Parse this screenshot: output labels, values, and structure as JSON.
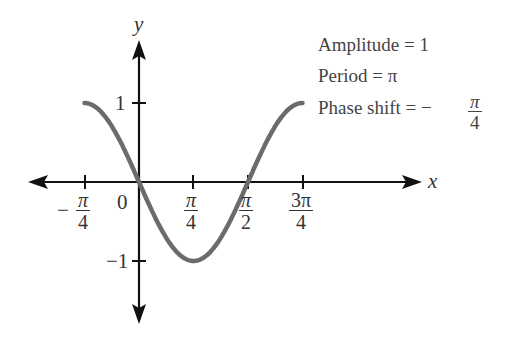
{
  "chart_data": {
    "type": "line",
    "title": "",
    "function": "y = cos(2(x + π/4)) = -sin(2x)",
    "xlabel": "x",
    "ylabel": "y",
    "x_ticks": [
      "-π/4",
      "0",
      "π/4",
      "π/2",
      "3π/4"
    ],
    "y_ticks": [
      "1",
      "-1"
    ],
    "x_range": [
      "-π/4",
      "3π/4"
    ],
    "ylim": [
      -1,
      1
    ],
    "grid": false,
    "series": [
      {
        "name": "curve",
        "color": "#6b6b6b",
        "x": [
          "-π/4",
          "0",
          "π/4",
          "π/2",
          "3π/4"
        ],
        "values": [
          1,
          0,
          -1,
          0,
          1
        ]
      }
    ],
    "annotations": [
      "Amplitude = 1",
      "Period = π",
      "Phase shift = − π/4"
    ]
  },
  "labels": {
    "x_axis": "x",
    "y_axis": "y",
    "y_tick_pos": "1",
    "y_tick_neg": "−1",
    "origin": "0",
    "neg_sign": "−",
    "pi": "π",
    "three_pi": "3π",
    "four": "4",
    "two": "2"
  },
  "annotations": {
    "amplitude": "Amplitude = 1",
    "period": "Period = π",
    "phase_prefix": "Phase shift = −",
    "phase_num": "π",
    "phase_den": "4"
  },
  "colors": {
    "axis": "#111111",
    "curve": "#6b6b6b",
    "text": "#333333"
  }
}
